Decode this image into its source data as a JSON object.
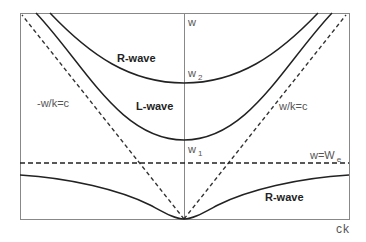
{
  "figure": {
    "axes": {
      "y_label": "w",
      "x_label": "ck"
    },
    "curves": [
      {
        "name": "upper-r-wave",
        "label": "R-wave",
        "style": "solid",
        "cutoff_label": "w",
        "cutoff_sub": "2"
      },
      {
        "name": "l-wave",
        "label": "L-wave",
        "style": "solid",
        "cutoff_label": "w",
        "cutoff_sub": "1"
      },
      {
        "name": "lower-r-wave",
        "label": "R-wave",
        "style": "solid"
      }
    ],
    "asymptotes": {
      "left": "-w/k=c",
      "right": "w/k=c",
      "horizontal_main": "w=W",
      "horizontal_sub": "e"
    },
    "colors": {
      "frame": "#888888",
      "curve": "#222222",
      "dash": "#333333",
      "text": "#333333"
    }
  }
}
